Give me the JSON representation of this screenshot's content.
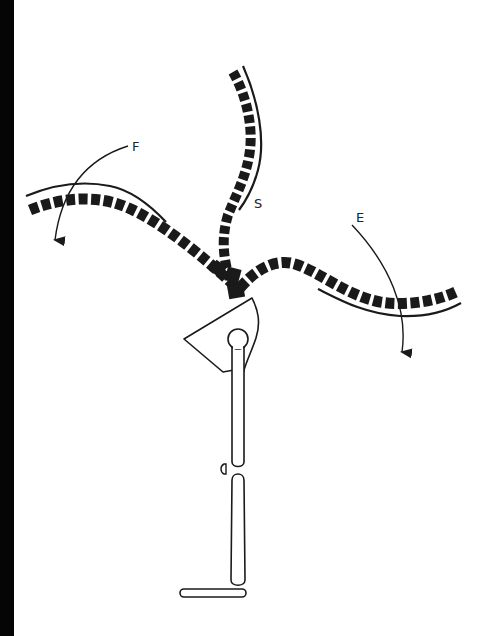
{
  "figure": {
    "labels": {
      "F": "F",
      "S": "S",
      "E": "E"
    },
    "arms": [
      {
        "id": "left-arm",
        "label": "F",
        "arrow_direction": "down-left"
      },
      {
        "id": "top-arm",
        "label": "S",
        "arrow_direction": "none"
      },
      {
        "id": "right-arm",
        "label": "E",
        "arrow_direction": "down"
      }
    ],
    "colors": {
      "ink": "#1a1a1a",
      "background": "#ffffff",
      "edge_bar": "#050505"
    }
  }
}
